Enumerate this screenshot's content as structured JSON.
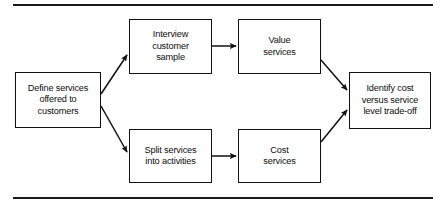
{
  "figure": {
    "type": "flowchart",
    "orientation": "left-to-right",
    "rules": {
      "top_divider": "horizontal-rule",
      "bottom_divider": "horizontal-rule"
    },
    "nodes": [
      {
        "id": "define",
        "label": "Define services\noffered to\ncustomers",
        "shape": "rectangle",
        "column": 1
      },
      {
        "id": "interview",
        "label": "Interview\ncustomer\nsample",
        "shape": "rectangle",
        "column": 2
      },
      {
        "id": "value",
        "label": "Value\nservices",
        "shape": "rectangle",
        "column": 3
      },
      {
        "id": "split",
        "label": "Split services\ninto activities",
        "shape": "rectangle",
        "column": 2
      },
      {
        "id": "cost",
        "label": "Cost\nservices",
        "shape": "rectangle",
        "column": 3
      },
      {
        "id": "identify",
        "label": "Identify cost\nversus service\nlevel trade-off",
        "shape": "rectangle",
        "column": 4
      }
    ],
    "edges": [
      {
        "id": "define-to-interview",
        "from": "define",
        "to": "interview",
        "style": "diagonal-up",
        "arrowhead": "filled-triangle"
      },
      {
        "id": "define-to-split",
        "from": "define",
        "to": "split",
        "style": "diagonal-down",
        "arrowhead": "filled-triangle"
      },
      {
        "id": "interview-to-value",
        "from": "interview",
        "to": "value",
        "style": "horizontal",
        "arrowhead": "filled-triangle"
      },
      {
        "id": "split-to-cost",
        "from": "split",
        "to": "cost",
        "style": "horizontal",
        "arrowhead": "filled-triangle"
      },
      {
        "id": "value-to-identify",
        "from": "value",
        "to": "identify",
        "style": "diagonal-down",
        "arrowhead": "filled-triangle"
      },
      {
        "id": "cost-to-identify",
        "from": "cost",
        "to": "identify",
        "style": "diagonal-up",
        "arrowhead": "filled-triangle"
      }
    ],
    "colors": {
      "stroke": "#111111",
      "background": "#ffffff",
      "text": "#0d0d0d"
    }
  }
}
